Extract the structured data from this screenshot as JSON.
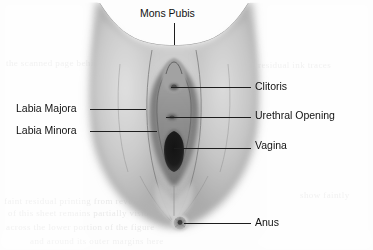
{
  "figure": {
    "style": "grayscale scanned medical illustration",
    "width": 373,
    "height": 250,
    "background_color": "#fdfdfd",
    "line_color": "#1d1d1d",
    "text_color": "#111111"
  },
  "labels": [
    {
      "id": "mons-pubis",
      "text": "Mons Pubis",
      "side": "top",
      "label_x": 140,
      "label_y": 8,
      "leader": {
        "orientation": "vertical",
        "x": 174,
        "y": 23,
        "length": 22
      }
    },
    {
      "id": "clitoris",
      "text": "Clitoris",
      "side": "right",
      "label_x": 255,
      "label_y": 81,
      "leader": {
        "orientation": "horizontal",
        "x": 171,
        "y": 87,
        "length": 80
      }
    },
    {
      "id": "urethral-opening",
      "text": "Urethral Opening",
      "side": "right",
      "label_x": 255,
      "label_y": 110,
      "leader": {
        "orientation": "horizontal",
        "x": 166,
        "y": 117,
        "length": 85
      }
    },
    {
      "id": "vagina",
      "text": "Vagina",
      "side": "right",
      "label_x": 255,
      "label_y": 140,
      "leader": {
        "orientation": "horizontal",
        "x": 174,
        "y": 148,
        "length": 77
      }
    },
    {
      "id": "anus",
      "text": "Anus",
      "side": "right",
      "label_x": 255,
      "label_y": 217,
      "leader": {
        "orientation": "horizontal",
        "x": 184,
        "y": 223,
        "length": 67
      }
    },
    {
      "id": "labia-majora",
      "text": "Labia Majora",
      "side": "left",
      "label_x": 16,
      "label_y": 103,
      "leader": {
        "orientation": "horizontal",
        "x": 90,
        "y": 109,
        "length": 56
      }
    },
    {
      "id": "labia-minora",
      "text": "Labia Minora",
      "side": "left",
      "label_x": 16,
      "label_y": 125,
      "leader": {
        "orientation": "horizontal",
        "x": 90,
        "y": 131,
        "length": 67
      }
    }
  ],
  "ghost_text": [
    {
      "text": "the scanned page behind shows through",
      "x": 6,
      "y": 58,
      "size": 9
    },
    {
      "text": "faint residual printing from reverse side",
      "x": 4,
      "y": 196,
      "size": 9
    },
    {
      "text": "of this sheet remains partially visible",
      "x": 8,
      "y": 208,
      "size": 9
    },
    {
      "text": "across the lower portion of the figure",
      "x": 6,
      "y": 222,
      "size": 9
    },
    {
      "text": "and around its outer margins here",
      "x": 30,
      "y": 236,
      "size": 9
    },
    {
      "text": "residual ink traces",
      "x": 258,
      "y": 60,
      "size": 9
    },
    {
      "text": "show faintly",
      "x": 300,
      "y": 190,
      "size": 9
    }
  ]
}
